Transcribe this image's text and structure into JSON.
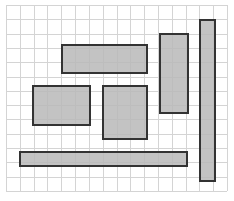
{
  "diagram": {
    "type": "grid-with-rectangles",
    "grid": {
      "x": 6,
      "y": 5,
      "width": 221,
      "height": 186,
      "columns": 16,
      "rows": 13,
      "line_color": "#d4d4d4"
    },
    "fill_color": "#b8b8b8",
    "stroke_color": "#333333",
    "rectangles": [
      {
        "id": "rect-top-horizontal",
        "x": 62,
        "y": 45,
        "w": 85,
        "h": 28
      },
      {
        "id": "rect-left-square",
        "x": 33,
        "y": 86,
        "w": 57,
        "h": 39
      },
      {
        "id": "rect-middle",
        "x": 103,
        "y": 86,
        "w": 44,
        "h": 53
      },
      {
        "id": "rect-right-tall",
        "x": 160,
        "y": 34,
        "w": 28,
        "h": 79
      },
      {
        "id": "rect-far-right-bar",
        "x": 200,
        "y": 20,
        "w": 15,
        "h": 161
      },
      {
        "id": "rect-bottom-long",
        "x": 20,
        "y": 152,
        "w": 167,
        "h": 14
      }
    ]
  }
}
